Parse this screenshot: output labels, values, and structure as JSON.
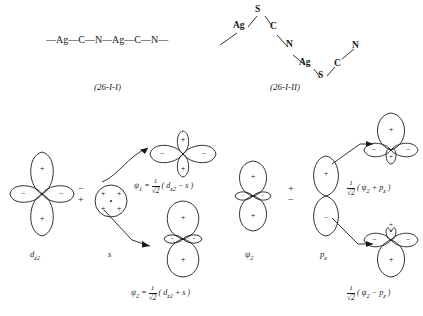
{
  "structures": [
    {
      "name": "chain-structure-1",
      "chain": "—Ag—C—N—Ag—C—N—",
      "caption": "(26-I-I)"
    },
    {
      "name": "chain-structure-2",
      "caption": "(26-I-II)",
      "atoms": [
        "S",
        "Ag",
        "C",
        "N",
        "Ag",
        "S",
        "C",
        "N"
      ]
    }
  ],
  "scheme_left": {
    "input_1_label": "d",
    "input_1_sub": "z2",
    "input_2_label": "s",
    "operator": "−\n+",
    "result_1_formula_psi": "ψ",
    "result_1_formula_psi_sub": "1",
    "result_1_equals": "=",
    "result_1_frac_num": "1",
    "result_1_frac_den": "√2",
    "result_1_expr": "( d",
    "result_1_expr_sub": "z2",
    "result_1_expr_tail": " − s )",
    "result_2_formula_psi": "ψ",
    "result_2_formula_psi_sub": "2",
    "result_2_equals": "=",
    "result_2_frac_num": "1",
    "result_2_frac_den": "√2",
    "result_2_expr": "( d",
    "result_2_expr_sub": "z2",
    "result_2_expr_tail": " + s )"
  },
  "scheme_right": {
    "input_1_label": "ψ",
    "input_1_sub": "2",
    "input_2_label": "p",
    "input_2_sub": "z",
    "operator": "+\n−",
    "result_1_frac_num": "1",
    "result_1_frac_den": "√2",
    "result_1_expr_open": "( ψ",
    "result_1_expr_sub1": "2",
    "result_1_expr_mid": " + p",
    "result_1_expr_sub2": "z",
    "result_1_expr_close": " )",
    "result_2_frac_num": "1",
    "result_2_frac_den": "√2",
    "result_2_expr_open": "( ψ",
    "result_2_expr_sub1": "2",
    "result_2_expr_mid": " − p",
    "result_2_expr_sub2": "z",
    "result_2_expr_close": " )"
  },
  "orbital_signs": {
    "plus": "+",
    "minus": "−"
  },
  "colors": {
    "ink": "#1a1a1a",
    "background": "#ffffff"
  }
}
